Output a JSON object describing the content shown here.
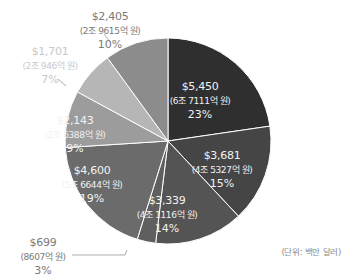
{
  "chart_data": {
    "type": "pie",
    "title": "",
    "unit_note": "(단위: 백만 달러)",
    "start_angle_deg": 0,
    "direction": "clockwise",
    "slices": [
      {
        "value": 5450,
        "label": "$5,450",
        "krw": "(6조 7111억 원)",
        "percent": "23%",
        "color": "#2f2f2f"
      },
      {
        "value": 3681,
        "label": "$3,681",
        "krw": "(4조 5327억 원)",
        "percent": "15%",
        "color": "#454545"
      },
      {
        "value": 3339,
        "label": "$3,339",
        "krw": "(4조 1116억 원)",
        "percent": "14%",
        "color": "#545454"
      },
      {
        "value": 699,
        "label": "$699",
        "krw": "(8607억 원)",
        "percent": "3%",
        "color": "#5f5f5f"
      },
      {
        "value": 4600,
        "label": "$4,600",
        "krw": "(5조 6644억 원)",
        "percent": "19%",
        "color": "#6b6b6b"
      },
      {
        "value": 2143,
        "label": "$2,143",
        "krw": "(2조 6388억 원)",
        "percent": "9%",
        "color": "#9c9c9c"
      },
      {
        "value": 1701,
        "label": "$1,701",
        "krw": "(2조 946억 원)",
        "percent": "7%",
        "color": "#b6b6b6"
      },
      {
        "value": 2405,
        "label": "$2,405",
        "krw": "(2조 9615억 원)",
        "percent": "10%",
        "color": "#8c8c8c"
      }
    ],
    "legend": null
  }
}
